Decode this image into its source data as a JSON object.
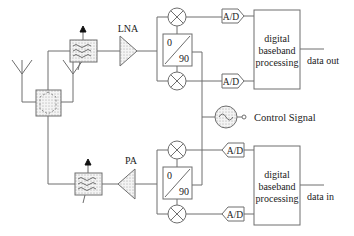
{
  "diagram": {
    "type": "rf-transceiver-block-diagram",
    "receive_chain": {
      "amplifier_label": "LNA",
      "phase_shifter": {
        "top_label": "0",
        "bottom_label": "90"
      },
      "adc_labels": [
        "A/D",
        "A/D"
      ],
      "baseband": {
        "line1": "digital",
        "line2": "baseband",
        "line3": "processing"
      },
      "output_label": "data out"
    },
    "transmit_chain": {
      "amplifier_label": "PA",
      "phase_shifter": {
        "top_label": "0",
        "bottom_label": "90"
      },
      "adc_labels": [
        "A/D",
        "A/D"
      ],
      "baseband": {
        "line1": "digital",
        "line2": "baseband",
        "line3": "processing"
      },
      "input_label": "data in"
    },
    "oscillator": {
      "label": "Control Signal"
    },
    "antenna_count": 2,
    "colors": {
      "line": "#6e6e6e",
      "fill": "#f2f2f2",
      "dots": "#555555",
      "text": "#222222"
    }
  }
}
